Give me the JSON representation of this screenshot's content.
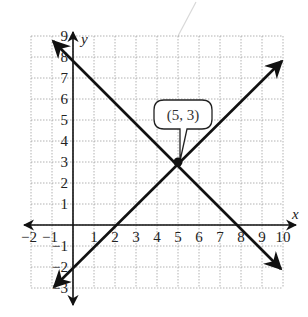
{
  "chart_data": {
    "type": "line",
    "title": "",
    "xlabel": "x",
    "ylabel": "y",
    "xlim": [
      -2,
      10
    ],
    "ylim": [
      -3,
      9
    ],
    "grid": true,
    "grid_style": "dotted",
    "x_ticks": [
      "-2",
      "-1",
      "1",
      "2",
      "3",
      "4",
      "5",
      "6",
      "7",
      "8",
      "9",
      "10"
    ],
    "y_ticks": [
      "9",
      "8",
      "7",
      "6",
      "5",
      "4",
      "3",
      "2",
      "1",
      "-1",
      "-2",
      "-3"
    ],
    "series": [
      {
        "name": "decreasing line",
        "equation": "y = -x + 8",
        "slope": -1,
        "y_intercept": 8,
        "x_intercept": 8,
        "points": [
          [
            -1,
            9
          ],
          [
            0,
            8
          ],
          [
            5,
            3
          ],
          [
            8,
            0
          ],
          [
            10,
            -2
          ]
        ]
      },
      {
        "name": "increasing line",
        "equation": "y = x - 2",
        "slope": 1,
        "y_intercept": -2,
        "x_intercept": 2,
        "points": [
          [
            -1,
            -3
          ],
          [
            0,
            -2
          ],
          [
            2,
            0
          ],
          [
            5,
            3
          ],
          [
            10,
            8
          ]
        ]
      }
    ],
    "annotations": [
      {
        "type": "point",
        "x": 5,
        "y": 3,
        "label": "(5, 3)",
        "style": "callout-bubble"
      }
    ]
  },
  "labels": {
    "x_axis": "x",
    "y_axis": "y",
    "callout": "(5, 3)"
  },
  "colors": {
    "lines": "#111111",
    "grid": "#9a9a9a",
    "text": "#222222"
  }
}
